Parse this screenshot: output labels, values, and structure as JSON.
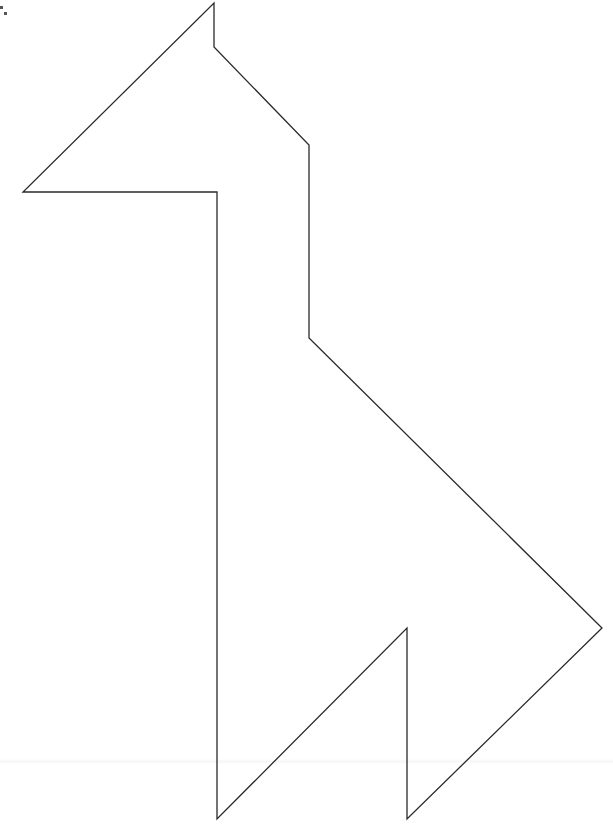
{
  "diagram": {
    "type": "tangram-outline",
    "stroke_color": "#2a2a2a",
    "background_color": "#ffffff",
    "stroke_width": 1.3,
    "outline_points": "214,3 214,47 309,145 309,338 602,628 407,819 407,628 217,819 217,192 23,192",
    "vertices": [
      {
        "x": 214,
        "y": 3
      },
      {
        "x": 214,
        "y": 47
      },
      {
        "x": 309,
        "y": 145
      },
      {
        "x": 309,
        "y": 338
      },
      {
        "x": 602,
        "y": 628
      },
      {
        "x": 407,
        "y": 819
      },
      {
        "x": 407,
        "y": 628
      },
      {
        "x": 217,
        "y": 819
      },
      {
        "x": 217,
        "y": 192
      },
      {
        "x": 23,
        "y": 192
      }
    ]
  },
  "corner_marks": [
    {
      "x": 0,
      "y": 6
    },
    {
      "x": 4,
      "y": 12
    }
  ]
}
